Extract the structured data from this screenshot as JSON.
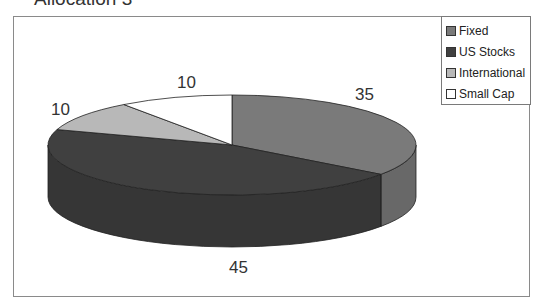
{
  "chart_data": {
    "type": "pie",
    "title": "Allocation 3",
    "categories": [
      "Fixed",
      "US Stocks",
      "International",
      "Small Cap"
    ],
    "values": [
      35,
      45,
      10,
      10
    ],
    "data_labels": [
      "35",
      "45",
      "10",
      "10"
    ],
    "colors": [
      "#7a7a7a",
      "#404040",
      "#b8b8b8",
      "#ffffff"
    ],
    "style": "3d",
    "legend_position": "top-right"
  },
  "title": "Allocation 3",
  "legend": {
    "items": [
      {
        "label": "Fixed",
        "color": "#7a7a7a"
      },
      {
        "label": "US Stocks",
        "color": "#404040"
      },
      {
        "label": "International",
        "color": "#b8b8b8"
      },
      {
        "label": "Small Cap",
        "color": "#ffffff"
      }
    ]
  },
  "labels": {
    "fixed": "35",
    "us_stocks": "45",
    "international": "10",
    "small_cap": "10"
  }
}
